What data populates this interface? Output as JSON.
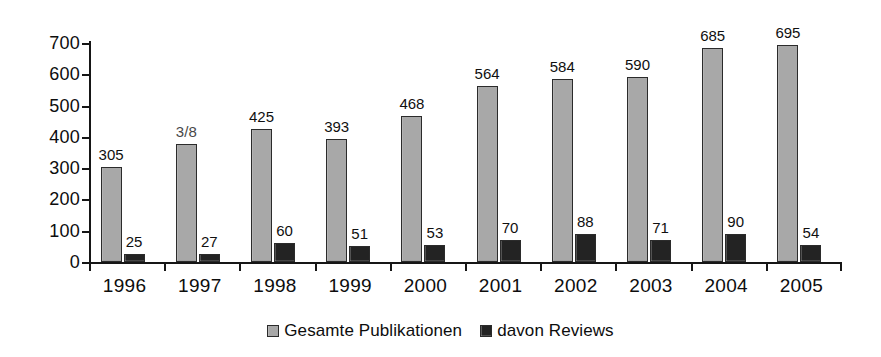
{
  "chart_data": {
    "type": "bar",
    "title": "",
    "subtitle": "",
    "xlabel": "",
    "ylabel": "",
    "ylim": [
      0,
      700
    ],
    "y_ticks": [
      0,
      100,
      200,
      300,
      400,
      500,
      600,
      700
    ],
    "y_tick_labels": [
      "0",
      "100",
      "200",
      "300",
      "400",
      "500",
      "600",
      "700"
    ],
    "grid": false,
    "legend_position": "bottom-center",
    "categories": [
      "1996",
      "1997",
      "1998",
      "1999",
      "2000",
      "2001",
      "2002",
      "2003",
      "2004",
      "2005"
    ],
    "series": [
      {
        "name": "Gesamte Publikationen",
        "color": "#a8a8a8",
        "values": [
          305,
          378,
          425,
          393,
          468,
          564,
          584,
          590,
          685,
          695
        ],
        "data_labels": [
          "305",
          "3/8",
          "425",
          "393",
          "468",
          "564",
          "584",
          "590",
          "685",
          "695"
        ],
        "data_label_notes": [
          "",
          "scan artifact: 378 rendered as 3/8",
          "",
          "",
          "",
          "",
          "",
          "",
          "",
          ""
        ]
      },
      {
        "name": "davon Reviews",
        "color": "#232323",
        "values": [
          25,
          27,
          60,
          51,
          53,
          70,
          88,
          71,
          90,
          54
        ],
        "data_labels": [
          "25",
          "27",
          "60",
          "51",
          "53",
          "70",
          "88",
          "71",
          "90",
          "54"
        ]
      }
    ]
  },
  "legend": {
    "items": [
      {
        "label": "Gesamte Publikationen",
        "swatch": "legend-swatch-total"
      },
      {
        "label": "davon Reviews",
        "swatch": "legend-swatch-reviews"
      }
    ]
  }
}
